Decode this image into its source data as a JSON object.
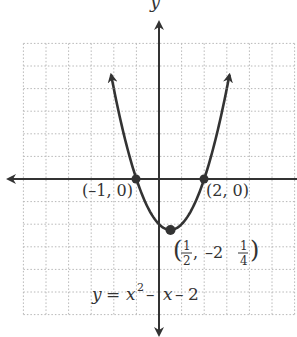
{
  "figure": {
    "axis_label_y": "y",
    "equation": {
      "lhs": "y",
      "eq": "=",
      "x1": "x",
      "sup": "2",
      "rest_minus1": "–",
      "x2": "x",
      "rest_minus2": "–",
      "const": "2"
    },
    "points": [
      {
        "label": "(–1, 0)",
        "x": -1,
        "y": 0
      },
      {
        "label": "(2, 0)",
        "x": 2,
        "y": 0
      }
    ],
    "vertex": {
      "x": 0.5,
      "y": -2.25,
      "open": "(",
      "num1": "1",
      "den1": "2",
      "comma": ",",
      "neg_whole": "–2",
      "num2": "1",
      "den2": "4",
      "close": ")"
    },
    "colors": {
      "curve": "#333333",
      "axis": "#333333",
      "grid": "#b8b8b8"
    }
  },
  "chart_data": {
    "type": "line",
    "title": "",
    "function": "y = x^2 - x - 2",
    "xlabel": "",
    "ylabel": "y",
    "xlim": [
      -6,
      6
    ],
    "ylim": [
      -6,
      6
    ],
    "grid": true,
    "x": [
      -2.1,
      -1.5,
      -1,
      -0.5,
      0,
      0.5,
      1,
      1.5,
      2,
      2.5,
      3.1
    ],
    "series": [
      {
        "name": "y = x^2 - x - 2",
        "values": [
          4.51,
          1.75,
          0,
          -1.25,
          -2,
          -2.25,
          -2,
          -1.25,
          0,
          1.75,
          4.51
        ]
      }
    ],
    "annotations": [
      {
        "text": "(-1, 0)",
        "x": -1,
        "y": 0
      },
      {
        "text": "(2, 0)",
        "x": 2,
        "y": 0
      },
      {
        "text": "(1/2, -2 1/4)",
        "x": 0.5,
        "y": -2.25
      },
      {
        "text": "y = x^2 - x - 2",
        "x": -1.5,
        "y": -5
      }
    ]
  }
}
